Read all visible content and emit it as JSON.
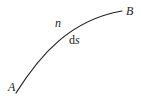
{
  "diagram": {
    "curve": {
      "start_label": "A",
      "end_label": "B",
      "path": "M16,93 C40,55 70,20 122,11",
      "stroke": "#222222"
    },
    "labels": {
      "n": "n",
      "ds_d": "d",
      "ds_s": "s"
    }
  }
}
